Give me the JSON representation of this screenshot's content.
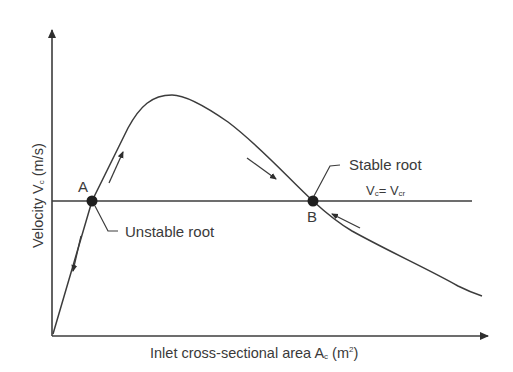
{
  "diagram": {
    "axes": {
      "x_label": "Inlet cross-sectional area A",
      "x_label_sub": "c",
      "x_label_unit_pre": " (m",
      "x_label_unit_sup": "2",
      "x_label_unit_post": ")",
      "y_label": "Velocity V",
      "y_label_sub": "c",
      "y_label_unit": " (m/s)"
    },
    "threshold_line": {
      "label_main": "V",
      "label_sub1": "c",
      "label_eq": "= V",
      "label_sub2": "cr"
    },
    "points": [
      {
        "id": "A",
        "label": "A",
        "annotation": "Unstable root"
      },
      {
        "id": "B",
        "label": "B",
        "annotation": "Stable root"
      }
    ],
    "colors": {
      "line": "#3c3c3c",
      "text": "#3a3a3a",
      "background": "#ffffff"
    }
  }
}
